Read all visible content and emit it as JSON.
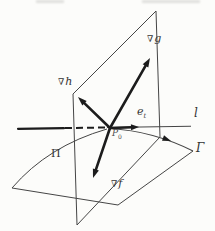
{
  "figure": {
    "colors": {
      "paper": "#fcfcfa",
      "ink": "#1c1c1c",
      "line": "#454545",
      "text": "#333333"
    },
    "labels": {
      "grad_g": {
        "nabla": "∇",
        "letter": "g"
      },
      "grad_h": {
        "nabla": "∇",
        "letter": "h"
      },
      "grad_f": {
        "nabla": "∇",
        "letter": "f"
      },
      "unit_tangent": {
        "letter": "e",
        "subscript": "t"
      },
      "point": {
        "letter": "P",
        "subscript": "0"
      },
      "tangent_line": "l",
      "curve": "Γ",
      "plane": "Π"
    }
  }
}
